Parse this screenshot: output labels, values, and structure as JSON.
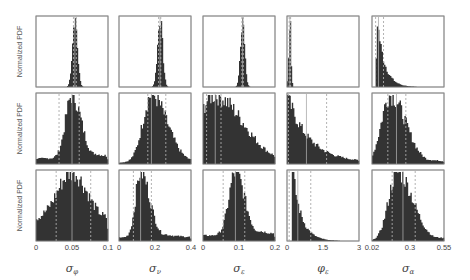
{
  "figure": {
    "ylabel": "Normalized PDF",
    "bar_color": "#333333",
    "frame_color": "#888888",
    "line_color": "#aaaaaa"
  },
  "chart_data": {
    "type": "heatmap_grid_of_histograms",
    "layout": {
      "rows": 3,
      "cols": 5
    },
    "ylabel": "Normalized PDF",
    "columns": [
      {
        "xlabel": "σ_φ",
        "symbol": "σ",
        "sub": "φ",
        "xlim": [
          0,
          0.1
        ],
        "ticks": [
          "0",
          "0.05",
          "0.1"
        ],
        "tick_pos": [
          0,
          0.5,
          1
        ]
      },
      {
        "xlabel": "σ_ν",
        "symbol": "σ",
        "sub": "ν",
        "xlim": [
          0,
          0.4
        ],
        "ticks": [
          "0",
          "0.2",
          "0.4"
        ],
        "tick_pos": [
          0,
          0.5,
          1
        ]
      },
      {
        "xlabel": "σ_ε",
        "symbol": "σ",
        "sub": "ε",
        "xlim": [
          0,
          0.2
        ],
        "ticks": [
          "0",
          "0.1",
          "0.2"
        ],
        "tick_pos": [
          0,
          0.5,
          1
        ]
      },
      {
        "xlabel": "φ_ε",
        "symbol": "φ",
        "sub": "ε",
        "xlim": [
          0,
          3
        ],
        "ticks": [
          "0",
          "1.5",
          "3"
        ],
        "tick_pos": [
          0,
          0.5,
          1
        ]
      },
      {
        "xlabel": "σ_α",
        "symbol": "σ",
        "sub": "α",
        "xlim": [
          0.02,
          0.55
        ],
        "ticks": [
          "0.02",
          "0.3",
          "0.55"
        ],
        "tick_pos": [
          0,
          0.528,
          1
        ]
      }
    ],
    "panels": [
      [
        {
          "shape": "spike",
          "center": 0.54,
          "width": 0.035,
          "lo": 0.52,
          "hi": 0.56,
          "median": 0.54,
          "floor": 0.0,
          "skew": 0
        },
        {
          "shape": "spike",
          "center": 0.57,
          "width": 0.035,
          "lo": 0.55,
          "hi": 0.58,
          "median": 0.57,
          "floor": 0.0,
          "skew": 0
        },
        {
          "shape": "spike",
          "center": 0.55,
          "width": 0.03,
          "lo": 0.54,
          "hi": 0.56,
          "median": 0.55,
          "floor": 0.0,
          "skew": 0
        },
        {
          "shape": "spike",
          "center": 0.04,
          "width": 0.015,
          "lo": 0.03,
          "hi": 0.05,
          "median": 0.04,
          "floor": 0.0,
          "skew": 0
        },
        {
          "shape": "decay",
          "center": 0.07,
          "width": 0.1,
          "lo": 0.05,
          "hi": 0.16,
          "median": 0.09,
          "floor": 0.0,
          "skew": 1
        }
      ],
      [
        {
          "shape": "peak",
          "center": 0.5,
          "width": 0.09,
          "lo": 0.32,
          "hi": 0.6,
          "median": 0.5,
          "floor": 0.08,
          "skew": 0.5
        },
        {
          "shape": "peak",
          "center": 0.45,
          "width": 0.12,
          "lo": 0.4,
          "hi": 0.65,
          "median": 0.45,
          "floor": 0.02,
          "skew": 1
        },
        {
          "shape": "peak",
          "center": 0.15,
          "width": 0.22,
          "lo": 0.05,
          "hi": 0.25,
          "median": 0.17,
          "floor": 0.02,
          "skew": 1
        },
        {
          "shape": "decay",
          "center": 0.0,
          "width": 0.3,
          "lo": 0.02,
          "hi": 0.55,
          "median": 0.27,
          "floor": 0.02,
          "skew": 1
        },
        {
          "shape": "peak",
          "center": 0.25,
          "width": 0.12,
          "lo": 0.22,
          "hi": 0.47,
          "median": 0.34,
          "floor": 0.01,
          "skew": 1
        }
      ],
      [
        {
          "shape": "peak",
          "center": 0.5,
          "width": 0.2,
          "lo": 0.28,
          "hi": 0.76,
          "median": 0.5,
          "floor": 0.3,
          "skew": 0
        },
        {
          "shape": "peak",
          "center": 0.3,
          "width": 0.07,
          "lo": 0.2,
          "hi": 0.45,
          "median": 0.3,
          "floor": 0.05,
          "skew": 1
        },
        {
          "shape": "peak",
          "center": 0.45,
          "width": 0.09,
          "lo": 0.28,
          "hi": 0.58,
          "median": 0.45,
          "floor": 0.08,
          "skew": 0.5
        },
        {
          "shape": "decay",
          "center": 0.08,
          "width": 0.12,
          "lo": 0.03,
          "hi": 0.33,
          "median": 0.15,
          "floor": 0.0,
          "skew": 1
        },
        {
          "shape": "peak",
          "center": 0.35,
          "width": 0.12,
          "lo": 0.28,
          "hi": 0.6,
          "median": 0.43,
          "floor": 0.0,
          "skew": 1
        }
      ]
    ]
  }
}
